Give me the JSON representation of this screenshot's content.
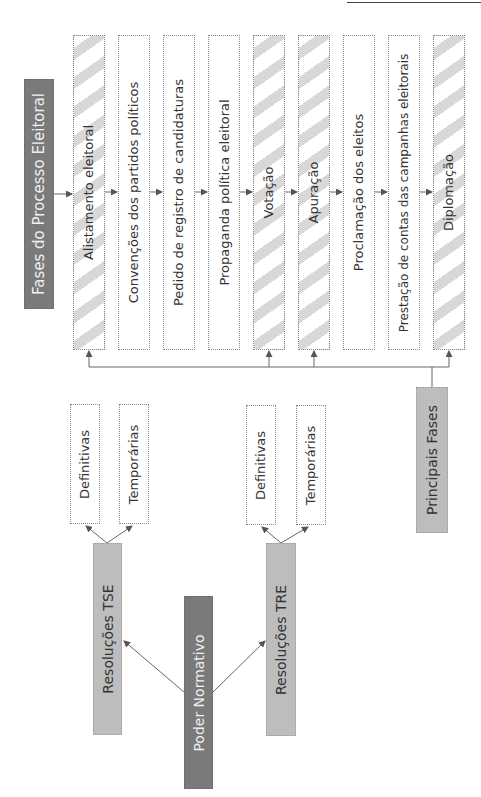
{
  "header": {
    "corner_mark": ""
  },
  "root_phases": {
    "label": "Fases do Processo Eleitoral"
  },
  "phases": [
    {
      "label": "Alistamento eleitoral",
      "principal": true
    },
    {
      "label": "Convenções dos partidos políticos",
      "principal": false
    },
    {
      "label": "Pedido de registro de candidaturas",
      "principal": false
    },
    {
      "label": "Propaganda política eleitoral",
      "principal": false
    },
    {
      "label": "Votação",
      "principal": true
    },
    {
      "label": "Apuração",
      "principal": true
    },
    {
      "label": "Proclamação dos eleitos",
      "principal": false
    },
    {
      "label": "Prestação de contas das campanhas eleitorais",
      "principal": false
    },
    {
      "label": "Diplomação",
      "principal": true
    }
  ],
  "principal_phases": {
    "label": "Principais Fases"
  },
  "normative": {
    "root": {
      "label": "Poder Normativo"
    },
    "tse": {
      "label": "Resoluções TSE",
      "children": [
        {
          "label": "Definitivas"
        },
        {
          "label": "Temporárias"
        }
      ]
    },
    "tre": {
      "label": "Resoluções TRE",
      "children": [
        {
          "label": "Definitivas"
        },
        {
          "label": "Temporárias"
        }
      ]
    }
  },
  "colors": {
    "dark_box": "#7a7a7a",
    "mid_box": "#bdbdbd",
    "hatch": "#d8d8d8",
    "line": "#555555"
  }
}
